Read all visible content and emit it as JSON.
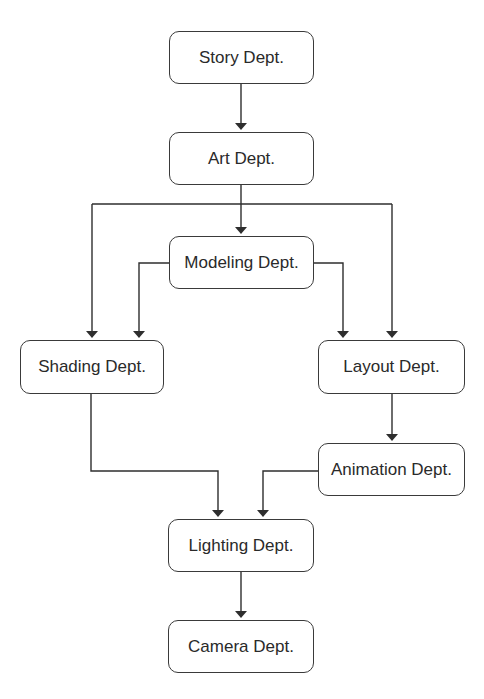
{
  "diagram": {
    "type": "flowchart",
    "line_color": "#2e2e2e",
    "nodes": [
      {
        "id": "story",
        "label": "Story Dept."
      },
      {
        "id": "art",
        "label": "Art Dept."
      },
      {
        "id": "modeling",
        "label": "Modeling Dept."
      },
      {
        "id": "shading",
        "label": "Shading Dept."
      },
      {
        "id": "layout",
        "label": "Layout Dept."
      },
      {
        "id": "animation",
        "label": "Animation Dept."
      },
      {
        "id": "lighting",
        "label": "Lighting Dept."
      },
      {
        "id": "camera",
        "label": "Camera Dept."
      }
    ],
    "edges": [
      {
        "from": "story",
        "to": "art"
      },
      {
        "from": "art",
        "to": "modeling"
      },
      {
        "from": "art",
        "to": "shading"
      },
      {
        "from": "art",
        "to": "layout"
      },
      {
        "from": "modeling",
        "to": "shading"
      },
      {
        "from": "modeling",
        "to": "layout"
      },
      {
        "from": "layout",
        "to": "animation"
      },
      {
        "from": "shading",
        "to": "lighting"
      },
      {
        "from": "animation",
        "to": "lighting"
      },
      {
        "from": "lighting",
        "to": "camera"
      }
    ]
  }
}
